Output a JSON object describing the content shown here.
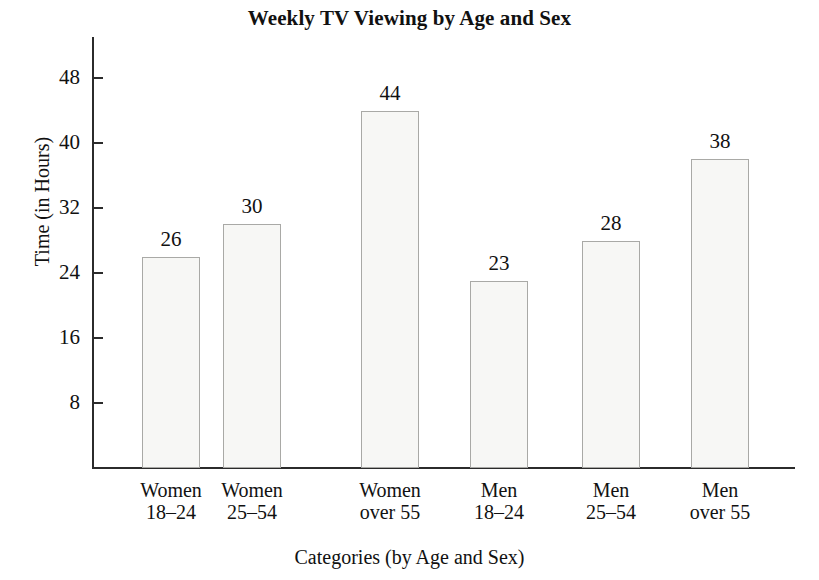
{
  "chart_data": {
    "type": "bar",
    "title": "Weekly TV Viewing by Age and Sex",
    "xlabel": "Categories (by Age and Sex)",
    "ylabel": "Time (in Hours)",
    "categories": [
      "Women 18–24",
      "Women 25–54",
      "Women over 55",
      "Men 18–24",
      "Men 25–54",
      "Men over 55"
    ],
    "category_lines": [
      [
        "Women",
        "18–24"
      ],
      [
        "Women",
        "25–54"
      ],
      [
        "Women",
        "over 55"
      ],
      [
        "Men",
        "18–24"
      ],
      [
        "Men",
        "25–54"
      ],
      [
        "Men",
        "over 55"
      ]
    ],
    "values": [
      26,
      30,
      44,
      23,
      28,
      38
    ],
    "value_labels": [
      "26",
      "30",
      "44",
      "23",
      "28",
      "38"
    ],
    "yticks": [
      8,
      16,
      24,
      32,
      40,
      48
    ],
    "ytick_labels": [
      "8",
      "16",
      "24",
      "32",
      "40",
      "48"
    ],
    "ylim": [
      0,
      52
    ],
    "grid": false,
    "legend": null,
    "bar_fill_color": "#f7f7f5",
    "bar_edge_color": "#a9a9a6",
    "axis_color": "#2b2b2b",
    "text_color": "#111111",
    "background_color": "#ffffff"
  }
}
